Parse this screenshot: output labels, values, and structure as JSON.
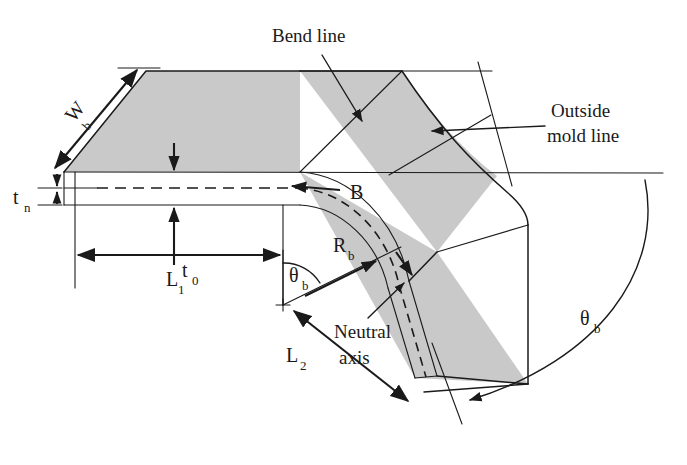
{
  "figure": {
    "background_color": "#ffffff",
    "line_color": "#1a1a1a",
    "fill_color": "#c9c9c9",
    "width": 687,
    "height": 465
  },
  "labels": {
    "bend_line": "Bend line",
    "outside_mold_line_1": "Outside",
    "outside_mold_line_2": "mold line",
    "neutral_1": "Neutral",
    "neutral_2": "axis",
    "bend_allowance": "B",
    "width_sym": "W",
    "width_sub": "b",
    "thickness_neutral_sym": "t",
    "thickness_neutral_sub": "n",
    "thickness_sym": "t",
    "thickness_sub": "0",
    "leg1_sym": "L",
    "leg1_sub": "1",
    "leg2_sym": "L",
    "leg2_sub": "2",
    "radius_sym": "R",
    "radius_sub": "b",
    "angle_inner_sym": "θ",
    "angle_inner_sub": "b",
    "angle_outer_sym": "θ",
    "angle_outer_sub": "b"
  },
  "annotations": [
    {
      "name": "bend-line-callout",
      "text": "Bend line"
    },
    {
      "name": "outside-mold-line-callout",
      "text": "Outside mold line"
    },
    {
      "name": "neutral-axis-callout",
      "text": "Neutral axis"
    },
    {
      "name": "bend-allowance-label",
      "text": "B"
    }
  ],
  "dimensions": [
    {
      "name": "blank-width",
      "symbol": "W",
      "subscript": "b"
    },
    {
      "name": "neutral-offset",
      "symbol": "t",
      "subscript": "n"
    },
    {
      "name": "sheet-thickness",
      "symbol": "t",
      "subscript": "0"
    },
    {
      "name": "flange-length-1",
      "symbol": "L",
      "subscript": "1"
    },
    {
      "name": "flange-length-2",
      "symbol": "L",
      "subscript": "2"
    },
    {
      "name": "bend-radius",
      "symbol": "R",
      "subscript": "b"
    },
    {
      "name": "bend-angle-inner",
      "symbol": "θ",
      "subscript": "b"
    },
    {
      "name": "bend-angle-outer",
      "symbol": "θ",
      "subscript": "b"
    }
  ]
}
